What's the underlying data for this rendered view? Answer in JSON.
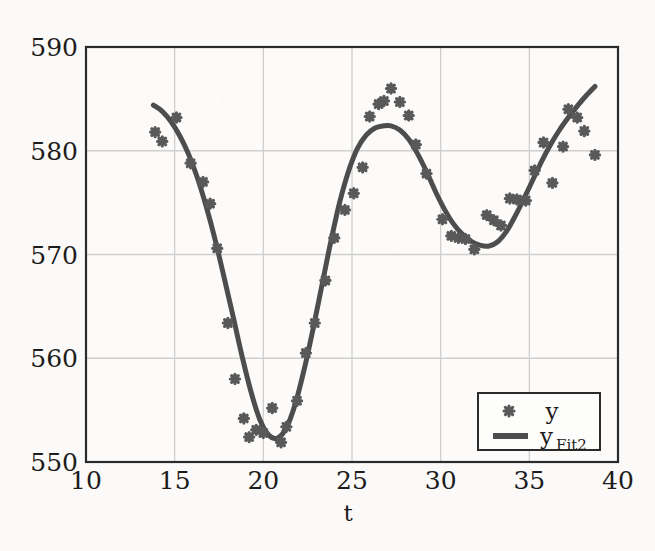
{
  "chart_data": {
    "type": "scatter",
    "title": "",
    "subtitle": "",
    "xlabel": "t",
    "ylabel": "",
    "xlim": [
      10,
      40
    ],
    "ylim": [
      550,
      590
    ],
    "xticks": [
      10,
      15,
      20,
      25,
      30,
      35,
      40
    ],
    "yticks": [
      550,
      560,
      570,
      580,
      590
    ],
    "xtick_labels": [
      "10",
      "15",
      "20",
      "25",
      "30",
      "35",
      "40"
    ],
    "ytick_labels": [
      "550",
      "560",
      "570",
      "580",
      "590"
    ],
    "grid": true,
    "legend_position": "lower-right",
    "series": [
      {
        "name": "y",
        "legend_label": "y",
        "type": "scatter",
        "marker": "asterisk",
        "color": "#595959",
        "points": [
          [
            13.9,
            581.8
          ],
          [
            14.3,
            580.9
          ],
          [
            15.1,
            583.2
          ],
          [
            15.9,
            578.8
          ],
          [
            16.6,
            577.0
          ],
          [
            17.0,
            574.9
          ],
          [
            17.4,
            570.6
          ],
          [
            18.0,
            563.4
          ],
          [
            18.4,
            558.0
          ],
          [
            18.9,
            554.2
          ],
          [
            19.2,
            552.4
          ],
          [
            19.6,
            553.1
          ],
          [
            20.0,
            552.8
          ],
          [
            20.5,
            555.2
          ],
          [
            21.0,
            551.9
          ],
          [
            21.3,
            553.4
          ],
          [
            21.9,
            555.9
          ],
          [
            22.4,
            560.5
          ],
          [
            22.9,
            563.4
          ],
          [
            23.5,
            567.5
          ],
          [
            24.0,
            571.6
          ],
          [
            24.6,
            574.3
          ],
          [
            25.1,
            575.9
          ],
          [
            25.6,
            578.4
          ],
          [
            26.0,
            583.3
          ],
          [
            26.5,
            584.5
          ],
          [
            26.8,
            584.8
          ],
          [
            27.2,
            586.0
          ],
          [
            27.7,
            584.7
          ],
          [
            28.2,
            583.4
          ],
          [
            28.6,
            580.6
          ],
          [
            29.2,
            577.8
          ],
          [
            30.1,
            573.4
          ],
          [
            30.6,
            571.8
          ],
          [
            31.0,
            571.6
          ],
          [
            31.4,
            571.5
          ],
          [
            31.9,
            570.5
          ],
          [
            32.6,
            573.8
          ],
          [
            33.0,
            573.3
          ],
          [
            33.4,
            572.8
          ],
          [
            33.9,
            575.4
          ],
          [
            34.3,
            575.3
          ],
          [
            34.8,
            575.2
          ],
          [
            35.3,
            578.1
          ],
          [
            35.8,
            580.8
          ],
          [
            36.3,
            576.9
          ],
          [
            36.9,
            580.4
          ],
          [
            37.2,
            584.0
          ],
          [
            37.7,
            583.2
          ],
          [
            38.1,
            581.9
          ],
          [
            38.7,
            579.6
          ]
        ]
      },
      {
        "name": "y_Fit2",
        "legend_label": "y",
        "legend_label_sub": "Fit2",
        "type": "line",
        "color": "#4d4d4d",
        "linewidth": 5,
        "points": [
          [
            13.8,
            584.4
          ],
          [
            14.3,
            583.8
          ],
          [
            14.8,
            582.8
          ],
          [
            15.3,
            581.4
          ],
          [
            15.8,
            579.6
          ],
          [
            16.3,
            577.3
          ],
          [
            16.8,
            574.5
          ],
          [
            17.3,
            571.3
          ],
          [
            17.8,
            567.7
          ],
          [
            18.3,
            564.0
          ],
          [
            18.8,
            560.2
          ],
          [
            19.3,
            556.8
          ],
          [
            19.8,
            554.1
          ],
          [
            20.3,
            552.6
          ],
          [
            20.8,
            552.3
          ],
          [
            21.3,
            553.3
          ],
          [
            21.8,
            555.6
          ],
          [
            22.3,
            558.9
          ],
          [
            22.8,
            562.8
          ],
          [
            23.3,
            567.0
          ],
          [
            23.8,
            571.2
          ],
          [
            24.3,
            575.0
          ],
          [
            24.8,
            578.0
          ],
          [
            25.3,
            580.2
          ],
          [
            25.8,
            581.5
          ],
          [
            26.3,
            582.2
          ],
          [
            26.8,
            582.4
          ],
          [
            27.2,
            582.4
          ],
          [
            27.7,
            582.0
          ],
          [
            28.2,
            581.1
          ],
          [
            28.7,
            579.7
          ],
          [
            29.2,
            578.0
          ],
          [
            29.7,
            576.1
          ],
          [
            30.2,
            574.4
          ],
          [
            30.7,
            573.0
          ],
          [
            31.2,
            572.0
          ],
          [
            31.7,
            571.3
          ],
          [
            32.2,
            570.9
          ],
          [
            32.7,
            570.8
          ],
          [
            33.2,
            571.2
          ],
          [
            33.7,
            572.2
          ],
          [
            34.2,
            573.7
          ],
          [
            34.7,
            575.4
          ],
          [
            35.2,
            577.2
          ],
          [
            35.7,
            579.0
          ],
          [
            36.2,
            580.6
          ],
          [
            36.7,
            582.0
          ],
          [
            37.2,
            583.2
          ],
          [
            37.7,
            584.3
          ],
          [
            38.2,
            585.3
          ],
          [
            38.7,
            586.2
          ]
        ]
      }
    ],
    "colors": {
      "marker": "#595959",
      "line": "#4d4d4d",
      "grid": "#cfcfcf",
      "frame": "#2b2b2b",
      "background": "#fbfaf8",
      "text": "#1c1c1c"
    }
  },
  "legend": {
    "entries": [
      {
        "label": "y",
        "sub": "",
        "glyph": "asterisk-marker-icon"
      },
      {
        "label": "y",
        "sub": "Fit2",
        "glyph": "line-swatch-icon"
      }
    ]
  },
  "axes": {
    "x_title": "t",
    "y_title": ""
  }
}
